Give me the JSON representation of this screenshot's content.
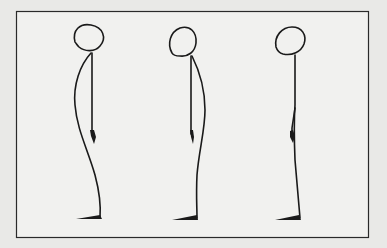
{
  "diagram": {
    "title": "",
    "frame": {
      "x": 16,
      "y": 11,
      "width": 353,
      "height": 227,
      "background": "#f1f1ef",
      "border": "#2a2a2a"
    },
    "colors": {
      "page_background": "#e9e9e7",
      "ink": "#1a1a1a"
    },
    "figures": [
      {
        "id": "figure-1",
        "name": "Figure with pronounced curved back (sway posture)",
        "head_center": [
          89,
          38
        ],
        "foot_x": 100
      },
      {
        "id": "figure-2",
        "name": "Figure with forward curved back",
        "head_center": [
          184,
          41
        ],
        "foot_x": 196
      },
      {
        "id": "figure-3",
        "name": "Figure with straight upright posture",
        "head_center": [
          291,
          41
        ],
        "foot_x": 300
      }
    ]
  }
}
